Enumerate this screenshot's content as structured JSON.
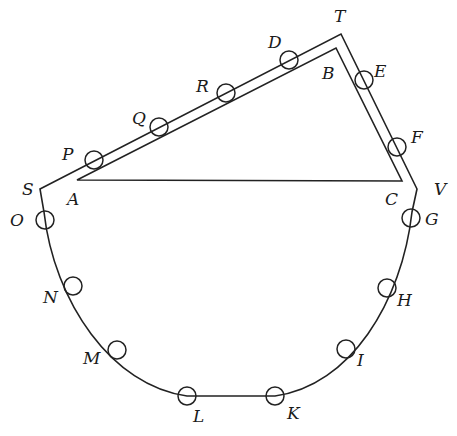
{
  "diagram": {
    "stroke_color": "#222222",
    "triangle": {
      "vertices": [
        {
          "name": "A",
          "x": 77,
          "y": 180,
          "label_x": 67,
          "label_y": 205
        },
        {
          "name": "B",
          "x": 336,
          "y": 48,
          "label_x": 322,
          "label_y": 79
        },
        {
          "name": "C",
          "x": 402,
          "y": 181,
          "label_x": 385,
          "label_y": 205
        }
      ]
    },
    "path": {
      "corners": [
        {
          "name": "S",
          "x": 40,
          "y": 189,
          "label_x": 22,
          "label_y": 195
        },
        {
          "name": "T",
          "x": 341,
          "y": 34,
          "label_x": 334,
          "label_y": 22
        },
        {
          "name": "V",
          "x": 417,
          "y": 189,
          "label_x": 434,
          "label_y": 195
        }
      ],
      "arc_left_end": {
        "x": 44,
        "y": 212
      },
      "arc_right_end": {
        "x": 412,
        "y": 212
      },
      "bottom_left": {
        "x": 187,
        "y": 396
      },
      "bottom_right": {
        "x": 275,
        "y": 396
      }
    },
    "markers": [
      {
        "name": "P",
        "x": 94,
        "y": 160,
        "label_x": 62,
        "label_y": 160
      },
      {
        "name": "Q",
        "x": 159,
        "y": 127,
        "label_x": 132,
        "label_y": 124
      },
      {
        "name": "R",
        "x": 226,
        "y": 93,
        "label_x": 196,
        "label_y": 92
      },
      {
        "name": "D",
        "x": 289,
        "y": 60,
        "label_x": 268,
        "label_y": 48
      },
      {
        "name": "E",
        "x": 364,
        "y": 80,
        "label_x": 374,
        "label_y": 77
      },
      {
        "name": "F",
        "x": 397,
        "y": 147,
        "label_x": 411,
        "label_y": 143
      },
      {
        "name": "G",
        "x": 411,
        "y": 218,
        "label_x": 425,
        "label_y": 225
      },
      {
        "name": "H",
        "x": 387,
        "y": 288,
        "label_x": 397,
        "label_y": 306
      },
      {
        "name": "I",
        "x": 346,
        "y": 349,
        "label_x": 357,
        "label_y": 366
      },
      {
        "name": "K",
        "x": 275,
        "y": 396,
        "label_x": 287,
        "label_y": 419
      },
      {
        "name": "L",
        "x": 187,
        "y": 396,
        "label_x": 193,
        "label_y": 422
      },
      {
        "name": "M",
        "x": 117,
        "y": 350,
        "label_x": 83,
        "label_y": 364
      },
      {
        "name": "N",
        "x": 73,
        "y": 286,
        "label_x": 43,
        "label_y": 303
      },
      {
        "name": "O",
        "x": 45,
        "y": 220,
        "label_x": 10,
        "label_y": 226
      }
    ],
    "marker_radius": 9
  }
}
